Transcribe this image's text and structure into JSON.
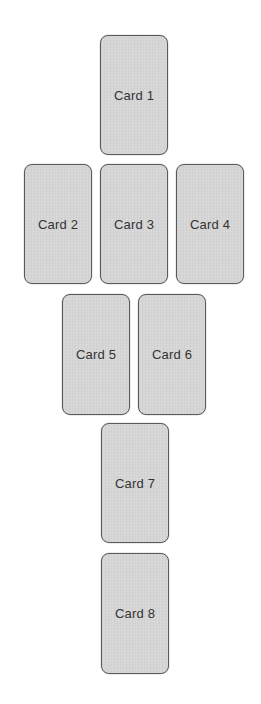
{
  "layout": {
    "title": "Card spread",
    "cards": [
      {
        "label": "Card 1",
        "position": "top-center"
      },
      {
        "label": "Card 2",
        "position": "row2-left"
      },
      {
        "label": "Card 3",
        "position": "row2-center"
      },
      {
        "label": "Card 4",
        "position": "row2-right"
      },
      {
        "label": "Card 5",
        "position": "row3-left"
      },
      {
        "label": "Card 6",
        "position": "row3-right"
      },
      {
        "label": "Card 7",
        "position": "row4-center"
      },
      {
        "label": "Card 8",
        "position": "row5-center"
      }
    ]
  },
  "colors": {
    "card_fill": "#d6d6d6",
    "card_border": "#5a5a5a",
    "text": "#333333",
    "background": "#ffffff"
  }
}
